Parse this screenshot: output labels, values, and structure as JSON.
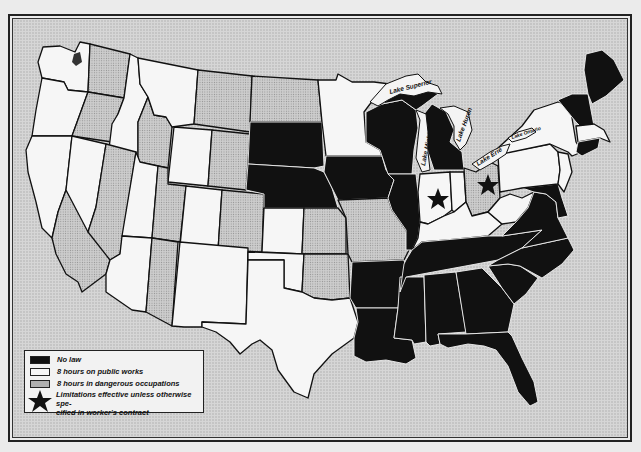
{
  "map": {
    "subject": "Hours of labor limitation laws by state (United States)",
    "colors": {
      "no_law": "#111111",
      "public_works": "#f6f6f6",
      "dangerous": "#cfcfcf",
      "water": "#d9d9d9",
      "border": "#111111"
    },
    "lakes": [
      {
        "name": "Lake Superior",
        "label": "Lake Superior"
      },
      {
        "name": "Lake Michigan",
        "label": "Lake Michigan"
      },
      {
        "name": "Lake Huron",
        "label": "Lake Huron"
      },
      {
        "name": "Lake Erie",
        "label": "Lake Erie"
      },
      {
        "name": "Lake Ontario",
        "label": "Lake Ontario"
      }
    ],
    "state_categories": {
      "no_law": [
        "South Dakota",
        "Nebraska",
        "Iowa",
        "Wisconsin",
        "Illinois",
        "Michigan",
        "Arkansas",
        "Louisiana",
        "Mississippi",
        "Alabama",
        "Georgia",
        "Florida",
        "Tennessee",
        "South Carolina",
        "North Carolina",
        "Virginia",
        "Maryland",
        "Delaware",
        "Maine",
        "Vermont",
        "New Hampshire",
        "Connecticut",
        "Rhode Island"
      ],
      "public_works_only": [
        "Minnesota",
        "Kentucky",
        "West Virginia",
        "Pennsylvania",
        "New York",
        "New Jersey",
        "Massachusetts",
        "Texas",
        "New Mexico"
      ],
      "public_works_and_dangerous": [
        "Washington",
        "Oregon",
        "California",
        "Nevada",
        "Idaho",
        "Montana",
        "Wyoming",
        "Utah",
        "Colorado",
        "Arizona",
        "Kansas",
        "Oklahoma",
        "Ohio",
        "Indiana"
      ],
      "dangerous_only": [
        "North Dakota",
        "Missouri"
      ],
      "starred": [
        "Indiana",
        "Ohio"
      ]
    }
  },
  "legend": {
    "items": [
      {
        "swatch": "black",
        "label": "No law"
      },
      {
        "swatch": "white",
        "label": "8 hours on public works"
      },
      {
        "swatch": "dotted",
        "label": "8 hours in dangerous occupations"
      },
      {
        "swatch": "star",
        "label": "Limitations effective unless otherwise specified in worker's contract",
        "line1": "Limitations effective unless otherwise spe-",
        "line2": "cified in worker's contract"
      }
    ]
  }
}
